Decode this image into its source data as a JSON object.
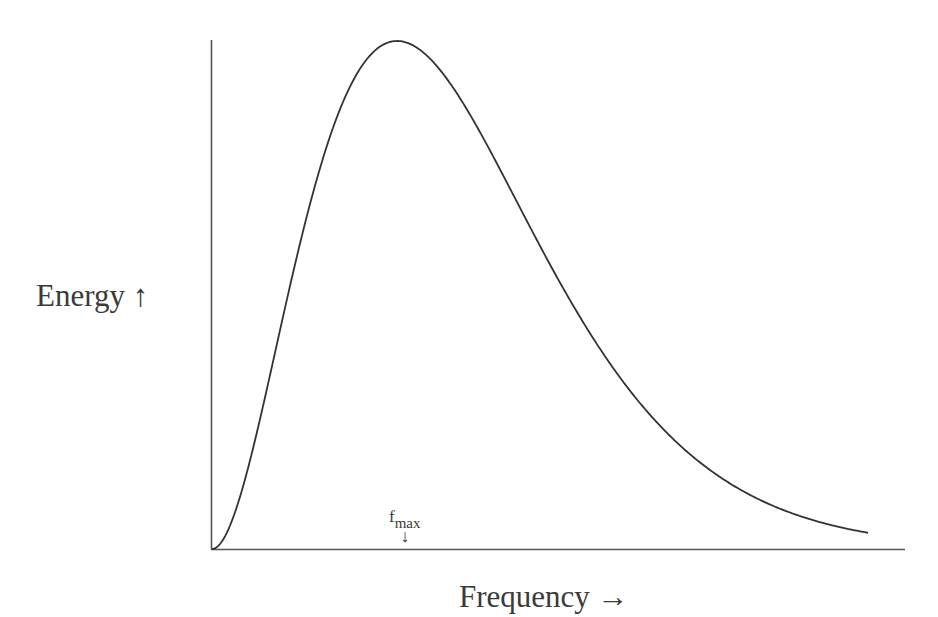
{
  "chart_data": {
    "type": "line",
    "title": "",
    "xlabel": "Frequency",
    "xlabel_arrow": "→",
    "ylabel": "Energy",
    "ylabel_arrow": "↑",
    "grid": false,
    "legend": null,
    "annotations": [
      {
        "text": "f",
        "subscript": "max",
        "arrow": "↓",
        "points_to": "peak frequency on x-axis"
      }
    ],
    "series": [
      {
        "name": "Blackbody spectral energy (Planck curve)",
        "function": "x^3/(e^x - 1)",
        "x_range": [
          0,
          10
        ],
        "peak_x": 2.82,
        "x": [
          0,
          0.5,
          1,
          1.5,
          2,
          2.5,
          2.82,
          3,
          3.5,
          4,
          5,
          6,
          7,
          8,
          9,
          10
        ],
        "values_normalized": [
          0,
          0.07,
          0.41,
          0.86,
          1.02,
          1.06,
          1.0,
          0.997,
          0.93,
          0.85,
          0.58,
          0.36,
          0.21,
          0.11,
          0.05,
          0.032
        ]
      }
    ],
    "axis_ticks": "none",
    "colors": {
      "line": "#333333",
      "axis": "#444444"
    }
  },
  "labels": {
    "y_axis": "Energy ↑",
    "x_axis": "Frequency →",
    "fmax_main": "f",
    "fmax_sub": "max",
    "fmax_arrow": "↓"
  }
}
